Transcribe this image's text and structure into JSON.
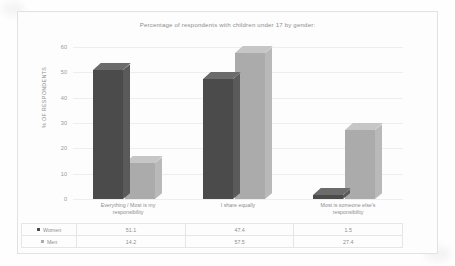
{
  "chart_data": {
    "type": "bar",
    "title": "Percentage of  respondents with children under 17 by gender:",
    "xlabel": "",
    "ylabel": "% OF RESPONDENTS",
    "ylim": [
      0,
      60
    ],
    "yticks": [
      "0",
      "10",
      "20",
      "30",
      "40",
      "50",
      "60"
    ],
    "grid": true,
    "legend_position": "bottom-table",
    "categories": [
      "Everything / Most is my responsibility",
      "I share equally",
      "Most is someone else's responsibility"
    ],
    "category_lines": [
      [
        "Everything / Most is my",
        "responsibility"
      ],
      [
        "I share equally"
      ],
      [
        "Most is someone else's",
        "responsibility"
      ]
    ],
    "series": [
      {
        "name": "Women",
        "color": "#4b4b4b",
        "values": [
          51.1,
          47.4,
          1.5
        ]
      },
      {
        "name": "Men",
        "color": "#ababab",
        "values": [
          14.2,
          57.5,
          27.4
        ]
      }
    ]
  },
  "table": {
    "rows": [
      {
        "label": "Women",
        "values": [
          "51.1",
          "47.4",
          "1.5"
        ]
      },
      {
        "label": "Men",
        "values": [
          "14.2",
          "57.5",
          "27.4"
        ]
      }
    ]
  },
  "colors": {
    "women": "#4b4b4b",
    "men": "#ababab",
    "frame": "#e2e2e2",
    "grid": "#eeeeee",
    "text": "#8d8d8d"
  }
}
